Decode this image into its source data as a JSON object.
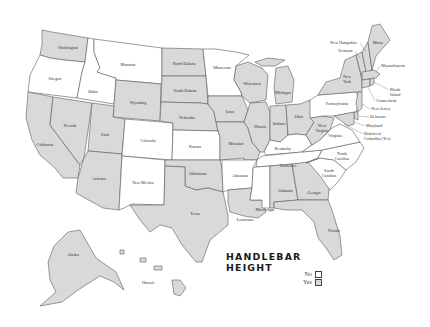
{
  "title": {
    "line1": "HANDLEBAR",
    "line2": "HEIGHT"
  },
  "legend": {
    "items": [
      {
        "label": "No",
        "color": "#ffffff"
      },
      {
        "label": "Yes",
        "color": "#d9d9d9"
      }
    ]
  },
  "colors": {
    "yes": "#d9d9d9",
    "no": "#ffffff",
    "border": "#5a5a5a"
  },
  "states": {
    "washington": {
      "label": "Washington",
      "value": "Yes"
    },
    "oregon": {
      "label": "Oregon",
      "value": "No"
    },
    "california": {
      "label": "California",
      "value": "Yes"
    },
    "idaho": {
      "label": "Idaho",
      "value": "No"
    },
    "nevada": {
      "label": "Nevada",
      "value": "Yes"
    },
    "montana": {
      "label": "Montana",
      "value": "No"
    },
    "wyoming": {
      "label": "Wyoming",
      "value": "Yes"
    },
    "utah": {
      "label": "Utah",
      "value": "Yes"
    },
    "arizona": {
      "label": "Arizona",
      "value": "Yes"
    },
    "colorado": {
      "label": "Colorado",
      "value": "No"
    },
    "new_mexico": {
      "label": "New Mexico",
      "value": "No"
    },
    "north_dakota": {
      "label": "North Dakota",
      "value": "Yes"
    },
    "south_dakota": {
      "label": "South Dakota",
      "value": "Yes"
    },
    "nebraska": {
      "label": "Nebraska",
      "value": "Yes"
    },
    "kansas": {
      "label": "Kansas",
      "value": "No"
    },
    "oklahoma": {
      "label": "Oklahoma",
      "value": "Yes"
    },
    "texas": {
      "label": "Texas",
      "value": "Yes"
    },
    "minnesota": {
      "label": "Minnesota",
      "value": "No"
    },
    "iowa": {
      "label": "Iowa",
      "value": "Yes"
    },
    "missouri": {
      "label": "Missouri",
      "value": "Yes"
    },
    "arkansas": {
      "label": "Arkansas",
      "value": "No"
    },
    "louisiana": {
      "label": "Louisiana",
      "value": "Yes"
    },
    "wisconsin": {
      "label": "Wisconsin",
      "value": "Yes"
    },
    "illinois": {
      "label": "Illinois",
      "value": "Yes"
    },
    "michigan": {
      "label": "Michigan",
      "value": "Yes"
    },
    "indiana": {
      "label": "Indiana",
      "value": "Yes"
    },
    "ohio": {
      "label": "Ohio",
      "value": "Yes"
    },
    "kentucky": {
      "label": "Kentucky",
      "value": "No"
    },
    "tennessee": {
      "label": "Tennessee",
      "value": "No"
    },
    "mississippi": {
      "label": "Mississippi",
      "value": "No"
    },
    "alabama": {
      "label": "Alabama",
      "value": "Yes"
    },
    "georgia": {
      "label": "Georgia",
      "value": "Yes"
    },
    "florida": {
      "label": "Florida",
      "value": "Yes"
    },
    "south_carolina": {
      "label1": "South",
      "label2": "Carolina",
      "value": "No"
    },
    "north_carolina": {
      "label1": "North",
      "label2": "Carolina",
      "value": "No"
    },
    "virginia": {
      "label": "Virginia",
      "value": "No"
    },
    "west_virginia": {
      "label1": "West",
      "label2": "Virginia",
      "value": "Yes"
    },
    "pennsylvania": {
      "label": "Pennsylvania",
      "value": "No"
    },
    "new_york": {
      "label1": "New",
      "label2": "York",
      "value": "Yes"
    },
    "vermont": {
      "label": "Vermont",
      "value": "Yes"
    },
    "new_hampshire": {
      "label": "New Hampshire",
      "value": "Yes"
    },
    "maine": {
      "label": "Maine",
      "value": "Yes"
    },
    "massachusetts": {
      "label": "Massachusetts",
      "value": "Yes"
    },
    "rhode_island": {
      "label1": "Rhode",
      "label2": "Island",
      "value": "Yes"
    },
    "connecticut": {
      "label": "Connecticut",
      "value": "Yes"
    },
    "new_jersey": {
      "label": "New Jersey",
      "value": "Yes"
    },
    "delaware": {
      "label": "Delaware",
      "value": "Yes"
    },
    "maryland": {
      "label": "Maryland",
      "value": "Yes"
    },
    "dc": {
      "label1": "District of",
      "label2": "Columbia (Yes)",
      "value": "Yes"
    },
    "alaska": {
      "label": "Alaska",
      "value": "Yes"
    },
    "hawaii": {
      "label": "Hawaii",
      "value": "Yes"
    }
  }
}
